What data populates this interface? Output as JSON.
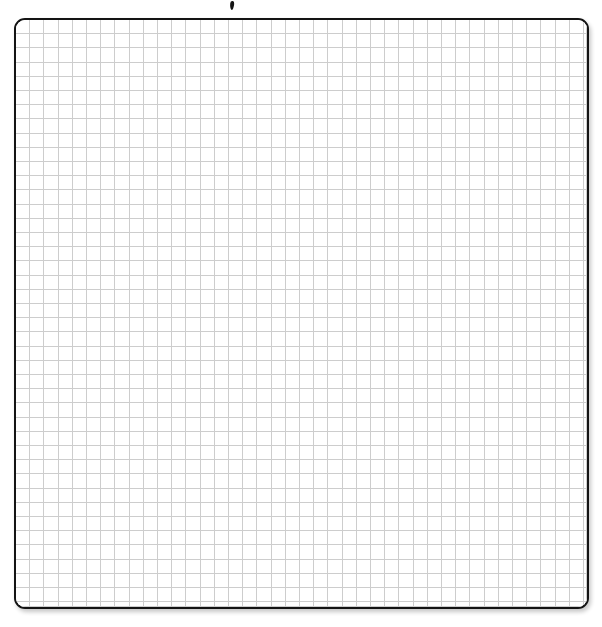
{
  "page": {
    "width": 602,
    "height": 627,
    "background_color": "#ffffff",
    "text_content": ""
  },
  "sheet": {
    "name": "graph-paper-sheet",
    "label": "",
    "left": 14,
    "top": 18,
    "width": 575,
    "height": 591,
    "border_color": "#141414",
    "border_width_px": 2.5,
    "corner_radius_px": 11,
    "fill_color": "#ffffff",
    "shadow": "2px 3px 4px rgba(0,0,0,0.22)"
  },
  "grid": {
    "name": "square-grid",
    "line_color": "#cdcdcd",
    "line_width_px": 1,
    "cell_size_px": 14.2,
    "columns": 40,
    "rows": 41,
    "orientation": "square"
  },
  "artifacts": [
    {
      "name": "ink-speck",
      "label": "",
      "left": 230,
      "top": 1,
      "width": 4,
      "height": 9,
      "color": "#141414"
    }
  ],
  "annotations": {
    "marks": [],
    "labels": [],
    "axis_labels": [],
    "tick_labels": [],
    "legend_entries": []
  }
}
